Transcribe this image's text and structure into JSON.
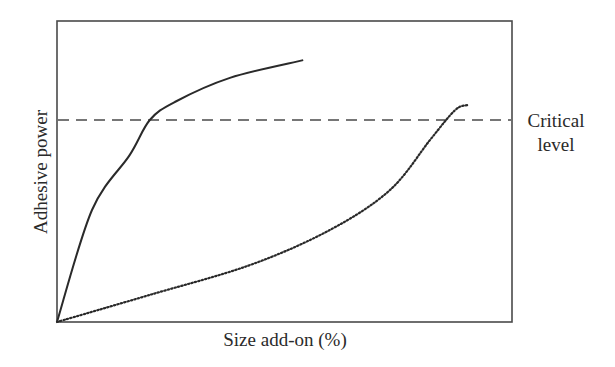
{
  "chart_data": {
    "type": "line",
    "title": "",
    "xlabel": "Size add-on (%)",
    "ylabel": "Adhesive power",
    "xlim": [
      0,
      100
    ],
    "ylim": [
      0,
      100
    ],
    "grid": false,
    "legend": null,
    "axis_ticks": "none (qualitative schematic; values normalized 0-100)",
    "series": [
      {
        "name": "Size A (solid curve, rapid rise)",
        "style": "solid",
        "x": [
          0,
          7.7,
          16.0,
          20.4,
          25.9,
          38.0,
          54.1
        ],
        "y": [
          0,
          37.2,
          55.5,
          67.1,
          73.1,
          81.1,
          87.0
        ]
      },
      {
        "name": "Size B (dotted curve, slow rise)",
        "style": "dotted",
        "x": [
          0,
          20.4,
          42.4,
          60.0,
          73.2,
          82.0,
          87.5,
          90.3
        ],
        "y": [
          0,
          9.0,
          18.9,
          30.6,
          43.9,
          60.5,
          70.4,
          72.1
        ]
      }
    ],
    "reference_lines": [
      {
        "type": "horizontal",
        "y": 67.1,
        "style": "dashed",
        "label": "Critical level"
      }
    ],
    "annotations": [
      {
        "text": "Critical level",
        "position": "right of plot, aligned with dashed line"
      }
    ]
  },
  "labels": {
    "xlabel": "Size add-on (%)",
    "ylabel": "Adhesive power",
    "critical_line1": "Critical",
    "critical_line2": "level"
  },
  "colors": {
    "axis": "#4a4a4a",
    "curve": "#2a2a2a",
    "text": "#2a2a2a",
    "background": "#ffffff"
  }
}
